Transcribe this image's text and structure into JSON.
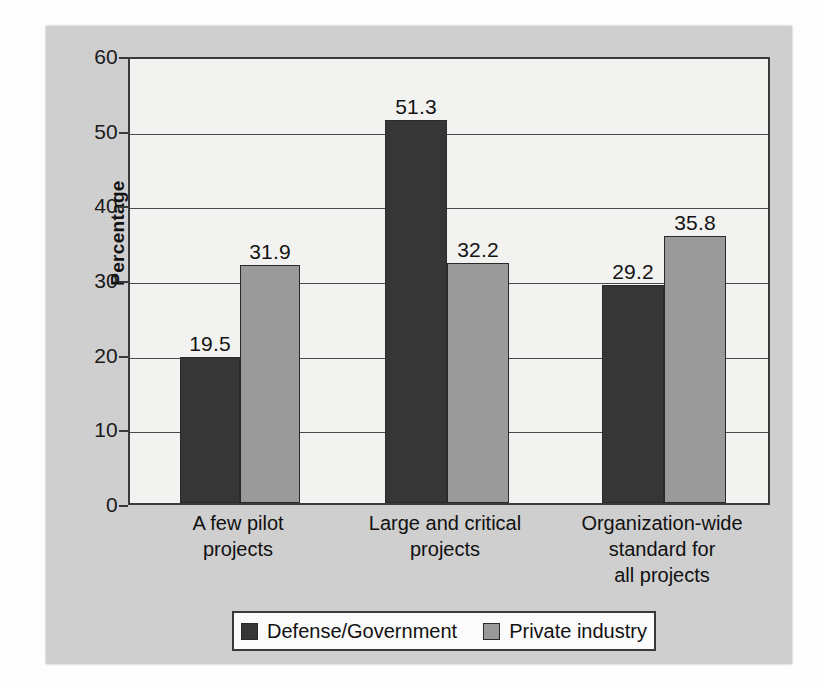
{
  "chart_data": {
    "type": "bar",
    "title": "",
    "xlabel": "",
    "ylabel": "Percentage",
    "ylim": [
      0,
      60
    ],
    "yticks": [
      0,
      10,
      20,
      30,
      40,
      50,
      60
    ],
    "grid": true,
    "legend_position": "bottom",
    "categories": [
      "A few pilot\nprojects",
      "Large and critical\nprojects",
      "Organization-wide\nstandard for\nall projects"
    ],
    "category_lines": [
      [
        "A few pilot",
        "projects"
      ],
      [
        "Large and critical",
        "projects"
      ],
      [
        "Organization-wide",
        "standard for",
        "all projects"
      ]
    ],
    "series": [
      {
        "name": "Defense/Government",
        "color": "#363636",
        "values": [
          19.5,
          51.3,
          29.2
        ],
        "labels": [
          "19.5",
          "51.3",
          "29.2"
        ]
      },
      {
        "name": "Private industry",
        "color": "#9a9a9a",
        "values": [
          31.9,
          32.2,
          35.8
        ],
        "labels": [
          "31.9",
          "32.2",
          "35.8"
        ]
      }
    ]
  },
  "axis": {
    "y_title": "Percentage",
    "y_tick_labels": [
      "60",
      "50",
      "40",
      "30",
      "20",
      "10",
      "0"
    ]
  },
  "legend": {
    "items": [
      {
        "label": "Defense/Government",
        "swatch": "dark"
      },
      {
        "label": "Private industry",
        "swatch": "light"
      }
    ]
  },
  "colors": {
    "panel_background": "#cfcfcf",
    "plot_background": "#f2f2f0",
    "series_dark": "#363636",
    "series_light": "#9a9a9a",
    "axis_line": "#3a3a3a",
    "text": "#111111"
  }
}
